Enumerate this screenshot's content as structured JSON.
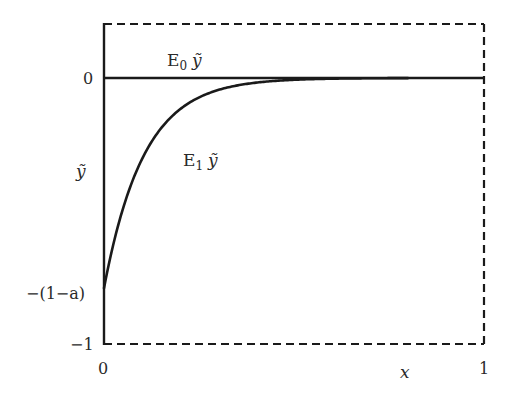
{
  "chart_data": {
    "type": "line",
    "title": "",
    "xlabel": "x",
    "ylabel": "ỹ",
    "xlim": [
      0,
      1
    ],
    "ylim": [
      -1,
      0.2
    ],
    "grid": false,
    "x_ticks": [
      {
        "value": 0,
        "label": "0"
      },
      {
        "value": 1,
        "label": "1"
      }
    ],
    "y_ticks": [
      {
        "value": 0,
        "label": "0"
      },
      {
        "value": -0.786,
        "label": "−(1−a)"
      },
      {
        "value": -1,
        "label": "−1"
      }
    ],
    "series": [
      {
        "name": "E₀ ỹ",
        "style": "solid",
        "x": [
          0,
          1
        ],
        "y": [
          0,
          0
        ]
      },
      {
        "name": "E₁ ỹ",
        "style": "solid",
        "description": "exponential rise from −(1−a) at x=0 toward 0",
        "x": [
          0,
          0.02,
          0.05,
          0.076,
          0.1,
          0.125,
          0.166,
          0.2,
          0.25,
          0.3,
          0.4,
          0.5,
          0.6,
          0.8,
          1.0
        ],
        "y": [
          -0.786,
          -0.65,
          -0.49,
          -0.383,
          -0.306,
          -0.238,
          -0.158,
          -0.118,
          -0.073,
          -0.045,
          -0.018,
          -0.007,
          -0.003,
          0,
          0
        ]
      }
    ],
    "annotations": [
      {
        "text": "E₀ ỹ",
        "x": 0.2,
        "y": 0.06
      },
      {
        "text": "E₁ ỹ",
        "x": 0.24,
        "y": -0.34
      }
    ],
    "frame": {
      "left": "solid",
      "top": "dashed",
      "right": "dashed",
      "bottom": "dashed",
      "top_value": 0.2
    },
    "parameters": {
      "a": 0.21,
      "decay_scale": 0.105
    }
  },
  "labels": {
    "e0_name": "E",
    "e0_sub": "0",
    "e0_var": "ỹ",
    "e1_name": "E",
    "e1_sub": "1",
    "e1_var": "ỹ",
    "ylabel": "ỹ",
    "xlabel": "x",
    "ytick_zero": "0",
    "ytick_one_minus_a": "−(1−a)",
    "ytick_minus_one": "−1",
    "xtick_zero": "0",
    "xtick_one": "1"
  },
  "colors": {
    "line": "#1a1a1a",
    "text": "#2a2a2a",
    "background": "#ffffff"
  }
}
